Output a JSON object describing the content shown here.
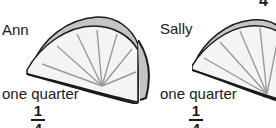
{
  "panels": [
    {
      "name": "Ann",
      "label": "one quarter",
      "fraction": {
        "numerator": "1",
        "denominator": "4"
      }
    },
    {
      "name": "Sally",
      "label": "one quarter",
      "fraction": {
        "numerator": "1",
        "denominator": "4"
      }
    }
  ],
  "top_right_digit": "4",
  "colors": {
    "outline": "#1a1a1a",
    "rind": "#bdbdbd",
    "flesh": "#f2f2f2",
    "segments": "#9a9a9a"
  }
}
